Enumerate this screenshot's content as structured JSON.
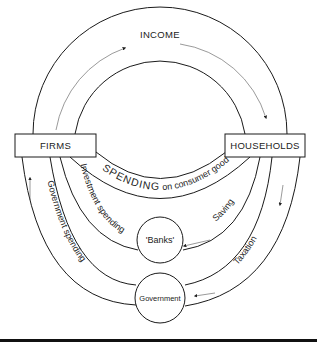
{
  "diagram": {
    "nodes": {
      "firms": "FIRMS",
      "households": "HOUSEHOLDS",
      "banks": "'Banks'",
      "government": "Government"
    },
    "flows": {
      "income": "INCOME",
      "spending_caps": "SPENDING",
      "spending_rest": " on consumer goods",
      "investment": "Investment spending",
      "saving": "Saving",
      "government_spending": "Government spending",
      "taxation": "Taxation"
    },
    "colors": {
      "line": "#1a1a1a",
      "background": "#ffffff",
      "rule": "#111111"
    }
  }
}
